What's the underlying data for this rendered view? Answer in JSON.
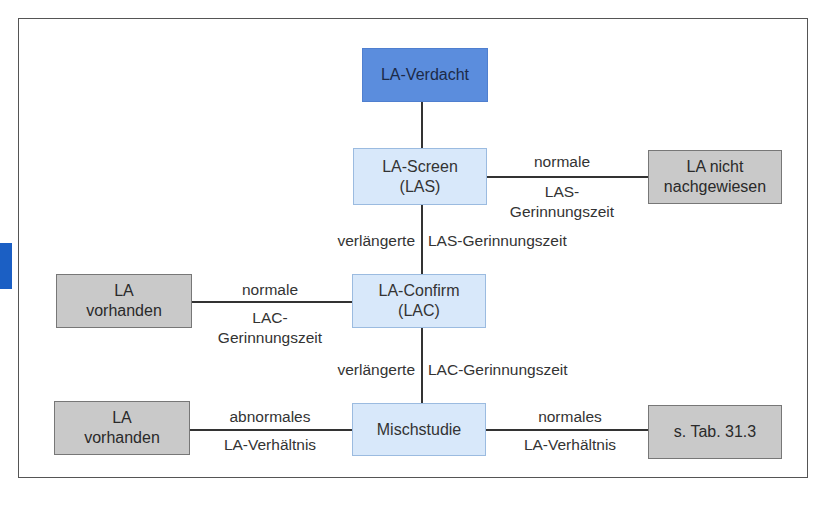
{
  "diagram": {
    "nodes": {
      "suspicion": "LA-Verdacht",
      "screen": "LA-Screen\n(LAS)",
      "not_detected": "LA nicht\nnachgewiesen",
      "confirm": "LA-Confirm\n(LAC)",
      "present_1": "LA\nvorhanden",
      "mixing": "Mischstudie",
      "present_2": "LA\nvorhanden",
      "see_table": "s. Tab. 31.3"
    },
    "edges": {
      "screen_normal_top": "normale",
      "screen_normal_bottom": "LAS-\nGerinnungszeit",
      "screen_prolonged_left": "verlängerte",
      "screen_prolonged_right": "LAS-Gerinnungszeit",
      "confirm_normal_top": "normale",
      "confirm_normal_bottom": "LAC-\nGerinnungszeit",
      "confirm_prolonged_left": "verlängerte",
      "confirm_prolonged_right": "LAC-Gerinnungszeit",
      "mix_abnormal_top": "abnormales",
      "mix_abnormal_bottom": "LA-Verhältnis",
      "mix_normal_top": "normales",
      "mix_normal_bottom": "LA-Verhältnis"
    },
    "colors": {
      "start_node": "#5b8ddd",
      "process_node": "#d8e8fa",
      "result_node": "#c9c9c9",
      "side_tab": "#1b5fc4"
    }
  }
}
